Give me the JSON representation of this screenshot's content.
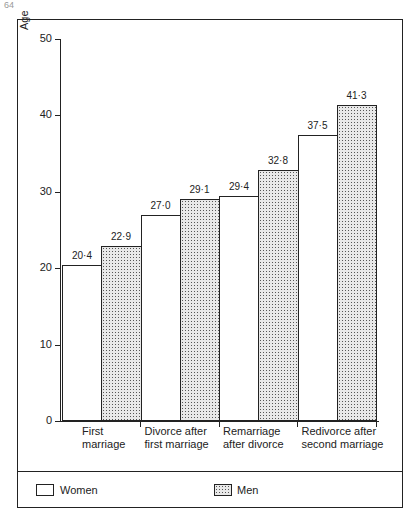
{
  "page_number": "64",
  "chart_data": {
    "type": "bar",
    "title": "",
    "xlabel": "",
    "ylabel": "Age",
    "ylim": [
      0,
      50
    ],
    "yticks": [
      0,
      10,
      20,
      30,
      40,
      50
    ],
    "categories": [
      "First marriage",
      "Divorce after first marriage",
      "Remarriage after divorce",
      "Redivorce after second marriage"
    ],
    "category_lines": [
      [
        "First",
        "marriage"
      ],
      [
        "Divorce after",
        "first marriage"
      ],
      [
        "Remarriage",
        "after divorce"
      ],
      [
        "Redivorce after",
        "second marriage"
      ]
    ],
    "series": [
      {
        "name": "Women",
        "values": [
          20.4,
          27.0,
          29.4,
          37.5
        ],
        "labels": [
          "20·4",
          "27·0",
          "29·4",
          "37·5"
        ],
        "fill": "#ffffff"
      },
      {
        "name": "Men",
        "values": [
          22.9,
          29.1,
          32.8,
          41.3
        ],
        "labels": [
          "22·9",
          "29·1",
          "32·8",
          "41·3"
        ],
        "fill": "dotted"
      }
    ],
    "grid": false,
    "legend_position": "bottom"
  },
  "legend": {
    "women": "Women",
    "men": "Men"
  }
}
